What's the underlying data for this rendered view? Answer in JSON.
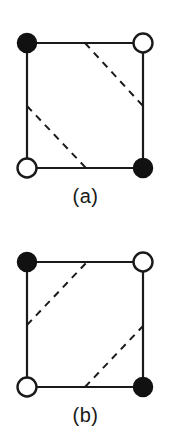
{
  "figure": {
    "type": "diagram",
    "background_color": "#ffffff",
    "line_color": "#1a1a1a",
    "filled_site_color": "#111111",
    "open_site_fill": "#ffffff",
    "solid_line_width": 2.2,
    "dashed_line_width": 2.0,
    "dash_pattern": "7 6",
    "site_radius": 9.5,
    "panels": [
      {
        "id": "a",
        "label": "(a)",
        "square": {
          "left": 27,
          "top": 43,
          "right": 143,
          "bottom": 168
        },
        "sites": [
          {
            "name": "top-left",
            "x": 27,
            "y": 43,
            "type": "filled"
          },
          {
            "name": "top-right",
            "x": 143,
            "y": 43,
            "type": "open"
          },
          {
            "name": "bottom-left",
            "x": 27,
            "y": 168,
            "type": "open"
          },
          {
            "name": "bottom-right",
            "x": 143,
            "y": 168,
            "type": "filled"
          }
        ],
        "solid_edges": [
          {
            "x1": 27,
            "y1": 43,
            "x2": 143,
            "y2": 43
          },
          {
            "x1": 143,
            "y1": 43,
            "x2": 143,
            "y2": 168
          },
          {
            "x1": 143,
            "y1": 168,
            "x2": 27,
            "y2": 168
          },
          {
            "x1": 27,
            "y1": 168,
            "x2": 27,
            "y2": 43
          }
        ],
        "dashed_lines": [
          {
            "name": "upper-diagonal",
            "x1": 85,
            "y1": 43,
            "x2": 143,
            "y2": 106
          },
          {
            "name": "lower-diagonal",
            "x1": 27,
            "y1": 106,
            "x2": 86,
            "y2": 168
          }
        ],
        "dashed_slope": "down-right"
      },
      {
        "id": "b",
        "label": "(b)",
        "square": {
          "left": 27,
          "top": 43,
          "right": 143,
          "bottom": 168
        },
        "sites": [
          {
            "name": "top-left",
            "x": 27,
            "y": 43,
            "type": "filled"
          },
          {
            "name": "top-right",
            "x": 143,
            "y": 43,
            "type": "open"
          },
          {
            "name": "bottom-left",
            "x": 27,
            "y": 168,
            "type": "open"
          },
          {
            "name": "bottom-right",
            "x": 143,
            "y": 168,
            "type": "filled"
          }
        ],
        "solid_edges": [
          {
            "x1": 27,
            "y1": 43,
            "x2": 143,
            "y2": 43
          },
          {
            "x1": 143,
            "y1": 43,
            "x2": 143,
            "y2": 168
          },
          {
            "x1": 143,
            "y1": 168,
            "x2": 27,
            "y2": 168
          },
          {
            "x1": 27,
            "y1": 168,
            "x2": 27,
            "y2": 43
          }
        ],
        "dashed_lines": [
          {
            "name": "upper-diagonal",
            "x1": 27,
            "y1": 106,
            "x2": 87,
            "y2": 43
          },
          {
            "name": "lower-diagonal",
            "x1": 85,
            "y1": 168,
            "x2": 143,
            "y2": 107
          }
        ],
        "dashed_slope": "up-right"
      }
    ]
  }
}
